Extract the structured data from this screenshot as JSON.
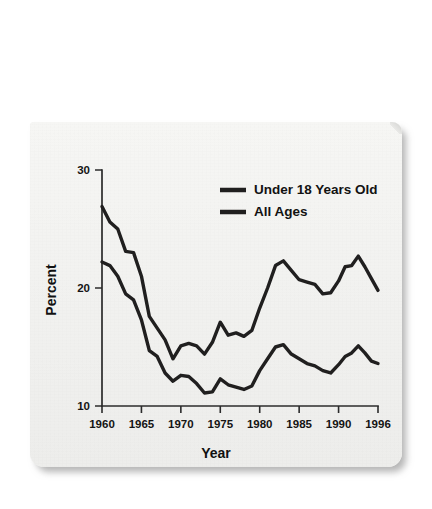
{
  "figure": {
    "background_color": "#f2f2f0",
    "ink_color": "#201f1f"
  },
  "chart_data": {
    "type": "line",
    "title": "",
    "xlabel": "Year",
    "ylabel": "Percent",
    "xlim": [
      1960,
      1996
    ],
    "ylim": [
      10,
      30
    ],
    "xticks": [
      1960,
      1965,
      1970,
      1975,
      1980,
      1985,
      1990,
      1996
    ],
    "xtick_labels": [
      "1960",
      "1965",
      "1970",
      "1975",
      "1980",
      "1985",
      "1990",
      "1996"
    ],
    "yticks": [
      10,
      20,
      30
    ],
    "ytick_labels": [
      "10",
      "20",
      "30"
    ],
    "grid": false,
    "legend_position": "upper right",
    "x": [
      1960,
      1961,
      1962,
      1963,
      1964,
      1965,
      1966,
      1967,
      1968,
      1969,
      1970,
      1971,
      1972,
      1973,
      1974,
      1975,
      1976,
      1977,
      1978,
      1979,
      1980,
      1981,
      1982,
      1983,
      1984,
      1985,
      1986,
      1987,
      1988,
      1989,
      1990,
      1991,
      1992,
      1993,
      1994,
      1995,
      1996
    ],
    "series": [
      {
        "name": "Under 18 Years Old",
        "color": "#201f1f",
        "values": [
          26.9,
          25.6,
          25.0,
          23.1,
          23.0,
          21.0,
          17.6,
          16.6,
          15.6,
          14.0,
          15.1,
          15.3,
          15.1,
          14.4,
          15.4,
          17.1,
          16.0,
          16.2,
          15.9,
          16.4,
          18.3,
          20.0,
          21.9,
          22.3,
          21.5,
          20.7,
          20.5,
          20.3,
          19.5,
          19.6,
          20.6,
          21.8,
          21.9,
          22.7,
          21.8,
          20.8,
          19.8
        ]
      },
      {
        "name": "All Ages",
        "color": "#201f1f",
        "values": [
          22.2,
          21.9,
          21.0,
          19.5,
          19.0,
          17.3,
          14.7,
          14.2,
          12.8,
          12.1,
          12.6,
          12.5,
          11.9,
          11.1,
          11.2,
          12.3,
          11.8,
          11.6,
          11.4,
          11.7,
          13.0,
          14.0,
          15.0,
          15.2,
          14.4,
          14.0,
          13.6,
          13.4,
          13.0,
          12.8,
          13.5,
          14.2,
          14.5,
          15.1,
          14.5,
          13.8,
          13.6
        ]
      }
    ]
  },
  "legend": {
    "entries": [
      {
        "label": "Under 18 Years Old"
      },
      {
        "label": "All Ages"
      }
    ]
  },
  "axes": {
    "y_title": "Percent",
    "x_title": "Year"
  }
}
